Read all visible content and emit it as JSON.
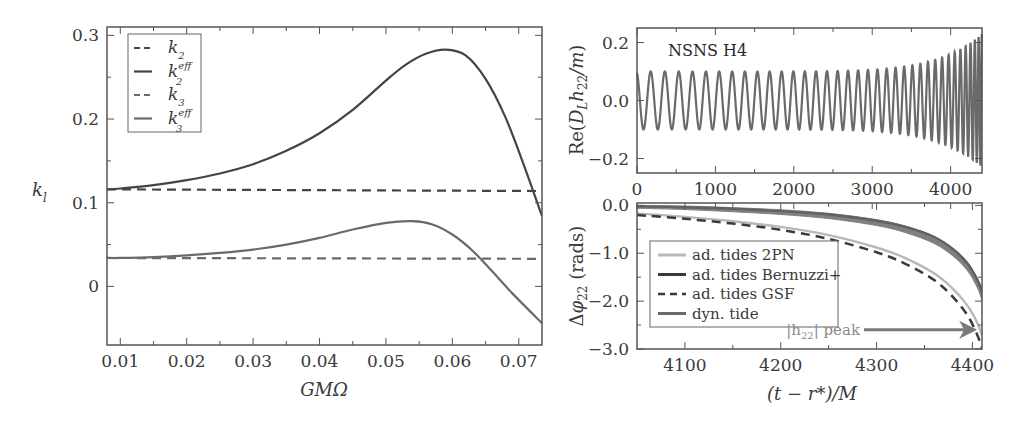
{
  "chart_data": [
    {
      "id": "left",
      "type": "line",
      "title": "",
      "xlabel": "GMΩ",
      "ylabel": "k_l",
      "xlim": [
        0.008,
        0.0735
      ],
      "ylim": [
        -0.07,
        0.31
      ],
      "xticks": [
        0.01,
        0.02,
        0.03,
        0.04,
        0.05,
        0.06,
        0.07
      ],
      "xtick_labels": [
        "0.01",
        "0.02",
        "0.03",
        "0.04",
        "0.05",
        "0.06",
        "0.07"
      ],
      "yticks": [
        0,
        0.1,
        0.2,
        0.3
      ],
      "ytick_labels": [
        "0",
        "0.1",
        "0.2",
        "0.3"
      ],
      "grid": false,
      "legend_position": "upper left",
      "legend": [
        {
          "label": "k_2",
          "base": "k",
          "sub": "2",
          "sup": "",
          "style": "dashed",
          "color": "#444444"
        },
        {
          "label": "k_2^eff",
          "base": "k",
          "sub": "2",
          "sup": "eff",
          "style": "solid",
          "color": "#444444"
        },
        {
          "label": "k_3",
          "base": "k",
          "sub": "3",
          "sup": "",
          "style": "dashed",
          "color": "#6a6a6a"
        },
        {
          "label": "k_3^eff",
          "base": "k",
          "sub": "3",
          "sup": "eff",
          "style": "solid",
          "color": "#6a6a6a"
        }
      ],
      "series": [
        {
          "name": "k_2",
          "style": "dashed",
          "color": "#444444",
          "x": [
            0.008,
            0.0735
          ],
          "y": [
            0.116,
            0.114
          ]
        },
        {
          "name": "k_2^eff",
          "style": "solid",
          "color": "#444444",
          "x": [
            0.008,
            0.01,
            0.015,
            0.02,
            0.025,
            0.03,
            0.035,
            0.04,
            0.045,
            0.05,
            0.053,
            0.056,
            0.059,
            0.062,
            0.065,
            0.068,
            0.071,
            0.0735
          ],
          "y": [
            0.116,
            0.117,
            0.121,
            0.127,
            0.135,
            0.146,
            0.162,
            0.183,
            0.211,
            0.246,
            0.265,
            0.278,
            0.283,
            0.276,
            0.248,
            0.202,
            0.14,
            0.084
          ]
        },
        {
          "name": "k_3",
          "style": "dashed",
          "color": "#6a6a6a",
          "x": [
            0.008,
            0.0735
          ],
          "y": [
            0.034,
            0.033
          ]
        },
        {
          "name": "k_3^eff",
          "style": "solid",
          "color": "#6a6a6a",
          "x": [
            0.008,
            0.01,
            0.015,
            0.02,
            0.025,
            0.03,
            0.035,
            0.04,
            0.045,
            0.05,
            0.054,
            0.057,
            0.06,
            0.063,
            0.066,
            0.069,
            0.0735
          ],
          "y": [
            0.034,
            0.034,
            0.035,
            0.037,
            0.04,
            0.044,
            0.05,
            0.058,
            0.068,
            0.076,
            0.078,
            0.074,
            0.062,
            0.043,
            0.018,
            -0.008,
            -0.044
          ]
        }
      ]
    },
    {
      "id": "top-right",
      "type": "line",
      "title": "NSNS H4",
      "xlabel": "",
      "ylabel": "Re(D_L h_22/m)",
      "xlim": [
        0,
        4400
      ],
      "ylim": [
        -0.25,
        0.25
      ],
      "xticks": [
        0,
        1000,
        2000,
        3000,
        4000
      ],
      "xtick_labels": [
        "0",
        "1000",
        "2000",
        "3000",
        "4000"
      ],
      "yticks": [
        0.2,
        0.0,
        -0.2
      ],
      "ytick_labels": [
        "0.2",
        "0.0",
        "−0.2"
      ],
      "grid": false,
      "series": [
        {
          "name": "Re(D_L h_22/m)",
          "style": "solid",
          "color": "#6a6a6a",
          "description": "chirping oscillation; amplitude ~0.1 rising to ~0.23 near merger; ~36 cycles from t=0 to t≈4400",
          "amplitude_start": 0.1,
          "amplitude_end": 0.23,
          "cycles": 36,
          "t_end": 4400
        }
      ]
    },
    {
      "id": "bottom-right",
      "type": "line",
      "title": "",
      "xlabel": "(t − r*)/M",
      "ylabel": "Δφ_22 (rads)",
      "xlim": [
        4050,
        4410
      ],
      "ylim": [
        -3.0,
        0.05
      ],
      "xticks": [
        4100,
        4200,
        4300,
        4400
      ],
      "xtick_labels": [
        "4100",
        "4200",
        "4300",
        "4400"
      ],
      "xticks_top": [
        0,
        1000,
        2000,
        3000,
        4000
      ],
      "yticks": [
        0.0,
        -1.0,
        -2.0,
        -3.0
      ],
      "ytick_labels": [
        "0.0",
        "−1.0",
        "−2.0",
        "−3.0"
      ],
      "grid": false,
      "legend_position": "center left",
      "legend": [
        {
          "label": "ad. tides 2PN",
          "style": "solid",
          "color": "#b8b8b8",
          "width": 3
        },
        {
          "label": "ad. tides Bernuzzi+",
          "style": "solid",
          "color": "#3a3a3a",
          "width": 3
        },
        {
          "label": "ad. tides GSF",
          "style": "dashed",
          "color": "#3a3a3a",
          "width": 2.5
        },
        {
          "label": "dyn. tide",
          "style": "solid",
          "color": "#6a6a6a",
          "width": 3
        }
      ],
      "annotations": [
        {
          "text": "|h22| peak",
          "x": 4405,
          "y": -2.6,
          "arrow_from_x": 4345,
          "arrow_to_x": 4405
        }
      ],
      "series": [
        {
          "name": "ad. tides 2PN",
          "style": "solid",
          "color": "#b8b8b8",
          "x": [
            4050,
            4100,
            4150,
            4200,
            4250,
            4300,
            4330,
            4360,
            4380,
            4395,
            4405,
            4410
          ],
          "y": [
            -0.17,
            -0.24,
            -0.33,
            -0.45,
            -0.62,
            -0.88,
            -1.1,
            -1.42,
            -1.75,
            -2.1,
            -2.45,
            -2.72
          ]
        },
        {
          "name": "ad. tides Bernuzzi+",
          "style": "solid",
          "color": "#3a3a3a",
          "x": [
            4050,
            4100,
            4150,
            4200,
            4250,
            4300,
            4330,
            4360,
            4380,
            4395,
            4405,
            4410
          ],
          "y": [
            -0.02,
            -0.04,
            -0.07,
            -0.12,
            -0.19,
            -0.32,
            -0.45,
            -0.66,
            -0.92,
            -1.22,
            -1.55,
            -1.8
          ]
        },
        {
          "name": "ad. tides GSF",
          "style": "dashed",
          "color": "#3a3a3a",
          "x": [
            4050,
            4100,
            4150,
            4200,
            4250,
            4300,
            4330,
            4360,
            4380,
            4395,
            4405,
            4410
          ],
          "y": [
            -0.2,
            -0.28,
            -0.38,
            -0.51,
            -0.7,
            -0.98,
            -1.22,
            -1.56,
            -1.92,
            -2.3,
            -2.7,
            -2.98
          ]
        },
        {
          "name": "dyn. tide",
          "style": "band",
          "color": "#6a6a6a",
          "x": [
            4050,
            4100,
            4150,
            4200,
            4250,
            4300,
            4330,
            4360,
            4380,
            4395,
            4405,
            4410
          ],
          "y": [
            -0.03,
            -0.05,
            -0.09,
            -0.14,
            -0.22,
            -0.36,
            -0.5,
            -0.72,
            -0.98,
            -1.28,
            -1.62,
            -1.88
          ],
          "band_halfwidth": 0.1
        }
      ]
    }
  ],
  "figure": {
    "left_panel": {
      "ylabel_base": "k",
      "ylabel_sub": "l",
      "xlabel": "GMΩ"
    },
    "top_right_panel": {
      "title": "NSNS H4",
      "ylabel": "Re(D_L h_22/m)"
    },
    "bottom_right_panel": {
      "ylabel": "Δφ_22 (rads)",
      "xlabel": "(t − r*)/M",
      "annotation": "|h22| peak"
    }
  }
}
